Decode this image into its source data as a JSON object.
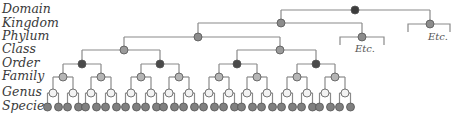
{
  "ranks": [
    {
      "label": "Domain",
      "y": 10
    },
    {
      "label": "Kingdom",
      "y": 24
    },
    {
      "label": "Phylum",
      "y": 37
    },
    {
      "label": "Class",
      "y": 50
    },
    {
      "label": "Order",
      "y": 64
    },
    {
      "label": "Family",
      "y": 77
    },
    {
      "label": "Genus",
      "y": 93
    },
    {
      "label": "Species",
      "y": 107
    }
  ],
  "etc_label": "Etc.",
  "colors": {
    "line": "#8a8a8a",
    "domain": "#3d3d3d",
    "kingdom": "#8c8c8c",
    "phylum": "#8c8c8c",
    "class": "#9a9a9a",
    "order": "#4a4a4a",
    "family": "#b5b5b5",
    "genus": "#f2f2f2",
    "species": "#7f7f7f",
    "stroke": "#555555"
  },
  "tree": {
    "domain": {
      "x": 355,
      "y": 10
    },
    "kingdoms": [
      {
        "x": 281,
        "y": 23,
        "expanded": true
      },
      {
        "x": 430,
        "y": 24,
        "expanded": false,
        "etc_bracket": [
          408,
          450
        ],
        "etc_x": 438,
        "etc_y": 40
      }
    ],
    "phyla": [
      {
        "x": 198,
        "y": 37,
        "expanded": true
      },
      {
        "x": 362,
        "y": 37,
        "expanded": false,
        "etc_bracket": [
          340,
          384
        ],
        "etc_x": 365,
        "etc_y": 52
      }
    ],
    "classes": [
      124,
      280
    ],
    "orders": [
      82,
      160,
      237,
      316
    ],
    "families": [
      63,
      101,
      141,
      179,
      219,
      257,
      297,
      335
    ],
    "genus_offset": 10,
    "species_offset": 5.5
  }
}
